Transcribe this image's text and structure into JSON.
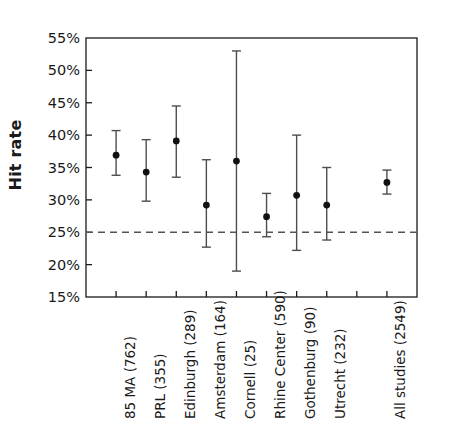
{
  "chart_data": {
    "type": "scatter",
    "title": "",
    "xlabel": "",
    "ylabel": "Hit rate",
    "ylim": [
      15,
      55
    ],
    "ytick_labels": [
      "55%",
      "50%",
      "45%",
      "40%",
      "35%",
      "30%",
      "25%",
      "20%",
      "15%"
    ],
    "ytick_values": [
      55,
      50,
      45,
      40,
      35,
      30,
      25,
      20,
      15
    ],
    "grid": false,
    "legend": "none",
    "reference_line": {
      "name": "chance-level",
      "value": 25,
      "style": "dashed",
      "label": "25%"
    },
    "categories": [
      "85 MA (762)",
      "PRL (355)",
      "Edinburgh (289)",
      "Amsterdam (164)",
      "Cornell (25)",
      "Rhine Center (590)",
      "Gothenburg (90)",
      "Utrecht (232)",
      "",
      "All studies (2549)"
    ],
    "points": [
      {
        "label": "85 MA (762)",
        "n": 762,
        "value": 36.9,
        "ci_low": 33.8,
        "ci_high": 40.7,
        "tick": 1
      },
      {
        "label": "PRL (355)",
        "n": 355,
        "value": 34.3,
        "ci_low": 29.8,
        "ci_high": 39.3,
        "tick": 2
      },
      {
        "label": "Edinburgh (289)",
        "n": 289,
        "value": 39.1,
        "ci_low": 33.5,
        "ci_high": 44.5,
        "tick": 3
      },
      {
        "label": "Amsterdam (164)",
        "n": 164,
        "value": 29.2,
        "ci_low": 22.7,
        "ci_high": 36.2,
        "tick": 4
      },
      {
        "label": "Cornell (25)",
        "n": 25,
        "value": 36.0,
        "ci_low": 19.0,
        "ci_high": 53.0,
        "tick": 5
      },
      {
        "label": "Rhine Center (590)",
        "n": 590,
        "value": 27.4,
        "ci_low": 24.3,
        "ci_high": 31.0,
        "tick": 6
      },
      {
        "label": "Gothenburg (90)",
        "n": 90,
        "value": 30.7,
        "ci_low": 22.2,
        "ci_high": 40.0,
        "tick": 7
      },
      {
        "label": "Utrecht (232)",
        "n": 232,
        "value": 29.2,
        "ci_low": 23.8,
        "ci_high": 35.0,
        "tick": 8
      },
      {
        "label": "All studies (2549)",
        "n": 2549,
        "value": 32.7,
        "ci_low": 30.9,
        "ci_high": 34.6,
        "tick": 10
      }
    ],
    "colors": {
      "axis": "#1a1a1a",
      "marker": "#111111",
      "errorbar": "#4d4d4d",
      "reference_line": "#555555",
      "background": "#ffffff",
      "text": "#1a1a1a"
    }
  }
}
